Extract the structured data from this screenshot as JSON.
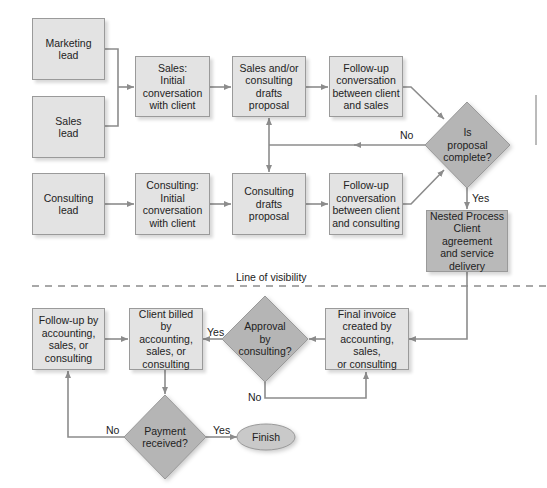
{
  "diagram": {
    "colors": {
      "box_fill": "#e3e3e3",
      "box_dark_fill": "#b9b9b9",
      "diamond_fill": "#b5b5b5",
      "line": "#8c8c8c"
    },
    "nodes": {
      "marketing_lead": "Marketing\nlead",
      "sales_lead": "Sales\nlead",
      "sales_initial": "Sales:\nInitial\nconversation\nwith client",
      "sales_consulting_drafts": "Sales and/or\nconsulting\ndrafts proposal",
      "followup_sales": "Follow-up\nconversation\nbetween client\nand sales",
      "is_proposal_complete": "Is\nproposal\ncomplete?",
      "consulting_lead": "Consulting\nlead",
      "consulting_initial": "Consulting:\nInitial\nconversation\nwith client",
      "consulting_drafts": "Consulting\ndrafts\nproposal",
      "followup_consulting": "Follow-up\nconversation\nbetween client\nand consulting",
      "nested_process": "Nested Process\nClient agreement\nand service\ndelivery",
      "final_invoice": "Final invoice\ncreated by\naccounting, sales,\nor consulting",
      "approval_by_consulting": "Approval\nby\nconsulting?",
      "client_billed": "Client billed by\naccounting,\nsales, or\nconsulting",
      "followup_accounting": "Follow-up by\naccounting,\nsales, or\nconsulting",
      "payment_received": "Payment\nreceived?",
      "finish": "Finish"
    },
    "edge_labels": {
      "proposal_no": "No",
      "proposal_yes": "Yes",
      "approval_yes": "Yes",
      "approval_no": "No",
      "payment_no": "No",
      "payment_yes": "Yes"
    },
    "line_of_visibility": "Line of visibility"
  }
}
